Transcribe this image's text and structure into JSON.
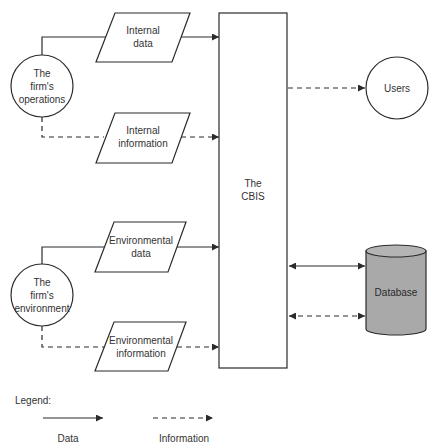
{
  "nodes": {
    "operations": {
      "lines": [
        "The",
        "firm's",
        "operations"
      ]
    },
    "environment": {
      "lines": [
        "The",
        "firm's",
        "environment"
      ]
    },
    "internal_data": {
      "lines": [
        "Internal",
        "data"
      ]
    },
    "internal_information": {
      "lines": [
        "Internal",
        "information"
      ]
    },
    "environmental_data": {
      "lines": [
        "Environmental",
        "data"
      ]
    },
    "environmental_information": {
      "lines": [
        "Environmental",
        "information"
      ]
    },
    "cbis": {
      "lines": [
        "The",
        "CBIS"
      ]
    },
    "users": {
      "label": "Users"
    },
    "database": {
      "label": "Database"
    }
  },
  "legend": {
    "title": "Legend:",
    "data_label": "Data",
    "information_label": "Information"
  },
  "colors": {
    "stroke": "#2b2b2b",
    "database_fill": "#a9a9a9",
    "background": "#ffffff"
  }
}
